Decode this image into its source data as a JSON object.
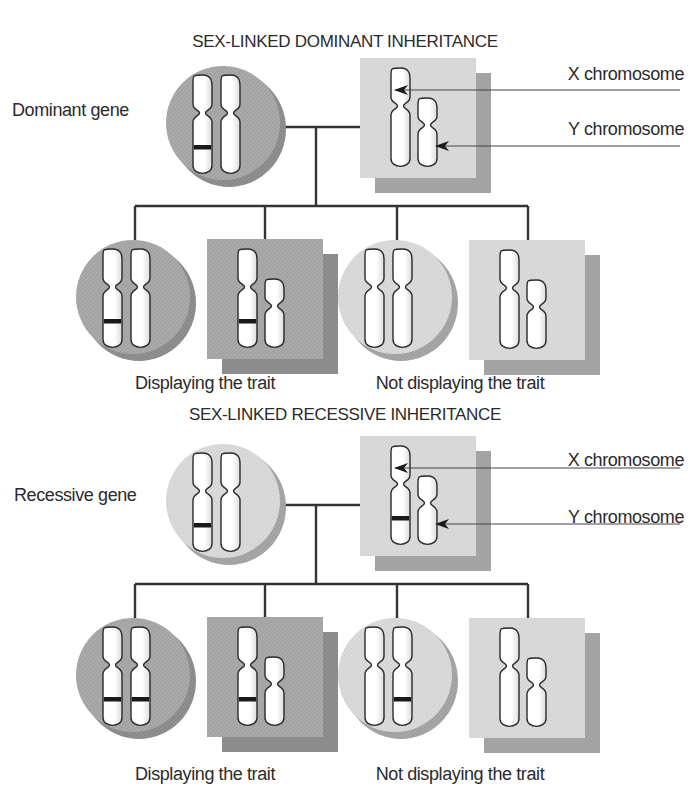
{
  "colors": {
    "dark_fill": "#a9a9a9",
    "dark_shadow": "#8d8d8d",
    "light_fill": "#d9d9d9",
    "light_shadow": "#a8a8a8",
    "chromosome": "#ffffff",
    "outline": "#2a2a2a",
    "gene_band": "#1a1a1a",
    "line": "#333333"
  },
  "sections": [
    {
      "title": "SEX-LINKED DOMINANT INHERITANCE",
      "gene_label": "Dominant gene",
      "x_label": "X chromosome",
      "y_label": "Y chromosome",
      "parents": {
        "female": {
          "shade": "dark",
          "gene_bands": [
            true,
            false
          ]
        },
        "male": {
          "shade": "light",
          "x_gene_band": false
        }
      },
      "children": [
        {
          "sex": "female",
          "shade": "dark",
          "gene_bands": [
            true,
            false
          ]
        },
        {
          "sex": "male",
          "shade": "dark",
          "x_gene_band": true
        },
        {
          "sex": "female",
          "shade": "light",
          "gene_bands": [
            false,
            false
          ]
        },
        {
          "sex": "male",
          "shade": "light",
          "x_gene_band": false
        }
      ],
      "caption_left": "Displaying the trait",
      "caption_right": "Not displaying the trait"
    },
    {
      "title": "SEX-LINKED RECESSIVE INHERITANCE",
      "gene_label": "Recessive gene",
      "x_label": "X chromosome",
      "y_label": "Y chromosome",
      "parents": {
        "female": {
          "shade": "light",
          "gene_bands": [
            true,
            false
          ]
        },
        "male": {
          "shade": "light",
          "x_gene_band": true
        }
      },
      "children": [
        {
          "sex": "female",
          "shade": "dark",
          "gene_bands": [
            true,
            true
          ]
        },
        {
          "sex": "male",
          "shade": "dark",
          "x_gene_band": true
        },
        {
          "sex": "female",
          "shade": "light",
          "gene_bands": [
            false,
            true
          ]
        },
        {
          "sex": "male",
          "shade": "light",
          "x_gene_band": false
        }
      ],
      "caption_left": "Displaying the trait",
      "caption_right": "Not displaying the trait"
    }
  ]
}
